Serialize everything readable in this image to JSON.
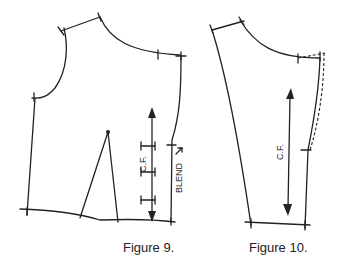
{
  "figures": [
    {
      "caption": "Figure 9.",
      "labels": {
        "center_front": "C.F.",
        "blend": "BLEND"
      }
    },
    {
      "caption": "Figure 10.",
      "labels": {
        "center_front": "C.F."
      }
    }
  ],
  "colors": {
    "line": "#222222",
    "background": "#ffffff"
  }
}
